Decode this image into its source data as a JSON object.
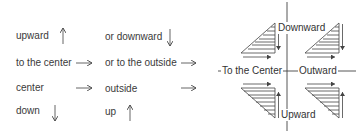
{
  "legend": {
    "rows": [
      {
        "left": "upward",
        "left_arrow": "up-arrow",
        "right": "or downward",
        "right_arrow": "down-arrow"
      },
      {
        "left": "to the center",
        "left_arrow": "right-arrow",
        "right": "or to the outside",
        "right_arrow": "right-arrow"
      },
      {
        "left": "center",
        "left_arrow": "right-arrow",
        "right": "outside",
        "right_arrow": "right-arrow"
      },
      {
        "left": "down",
        "left_arrow": "down-arrow",
        "right": "up",
        "right_arrow": "up-arrow"
      }
    ]
  },
  "diagram": {
    "top_label": "Downward",
    "left_label": "To the Center",
    "right_label": "Outward",
    "bottom_label": "Upward",
    "quadrants": [
      {
        "position": "top-left",
        "shape": "hatched-triangle",
        "arrows": [
          "down-arrow",
          "right-arrow"
        ]
      },
      {
        "position": "top-right",
        "shape": "hatched-triangle",
        "arrows": [
          "down-arrow",
          "right-arrow"
        ]
      },
      {
        "position": "bottom-left",
        "shape": "hatched-triangle",
        "arrows": [
          "right-arrow",
          "up-arrow"
        ]
      },
      {
        "position": "bottom-right",
        "shape": "hatched-triangle",
        "arrows": [
          "right-arrow",
          "up-arrow"
        ]
      }
    ]
  },
  "colors": {
    "line": "#444444",
    "text": "#333333",
    "background": "#ffffff"
  }
}
